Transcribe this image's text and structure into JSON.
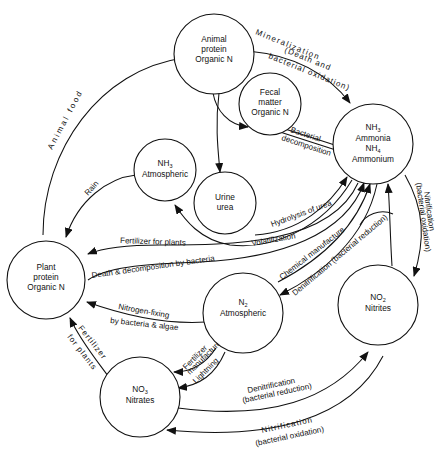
{
  "diagram": {
    "type": "flow-diagram",
    "colors": {
      "line": "#111111",
      "background": "#ffffff"
    },
    "nodes": {
      "animal_protein": {
        "line1": "Animal",
        "line2": "protein",
        "line3": "Organic N"
      },
      "fecal_matter": {
        "line1": "Fecal",
        "line2": "matter",
        "line3": "Organic N"
      },
      "ammonia": {
        "line1": "NH",
        "line1_sub": "3",
        "line2": "Ammonia",
        "line3": "NH",
        "line3_sub": "4",
        "line4": "Ammonium"
      },
      "nh3_atmospheric": {
        "line1": "NH",
        "line1_sub": "3",
        "line2": "Atmospheric"
      },
      "urine": {
        "line1": "Urine",
        "line2": "urea"
      },
      "plant_protein": {
        "line1": "Plant",
        "line2": "protein",
        "line3": "Organic N"
      },
      "n2_atmospheric": {
        "line1": "N",
        "line1_sub": "2",
        "line2": "Atmospheric"
      },
      "nitrites": {
        "line1": "NO",
        "line1_sub": "2",
        "line2": "Nitrites"
      },
      "nitrates": {
        "line1": "NO",
        "line1_sub": "3",
        "line2": "Nitrates"
      }
    },
    "edges": {
      "animal_food": "Animal food",
      "mineralization_1": "Mineralization",
      "mineralization_2": "(Death and",
      "mineralization_3": "bacterial oxidation)",
      "bacterial_decomposition_1": "Bacterial",
      "bacterial_decomposition_2": "decomposition",
      "rain": "Rain",
      "hydrolysis": "Hydrolysis of urea",
      "volatilization": "Volatilization",
      "fertilizer_for_plants": "Fertilizer for plants",
      "death_decomposition": "Death & decomposition by bacteria",
      "chemical_manufacture": "Chemical manufacture",
      "denitrification_upper": "Denitrification (bacterial reduction)",
      "nitrification_right_1": "Nitrification",
      "nitrification_right_2": "(bacterial oxidation)",
      "nitrogen_fixing_1": "Nitrogen-fixing",
      "nitrogen_fixing_2": "by bacteria & algae",
      "fertilizer_left_1": "Fertilizer",
      "fertilizer_left_2": "for plants",
      "fertilizer_manufacture_1": "Fertilizer",
      "fertilizer_manufacture_2": "manufacture",
      "lightning": "Lightning",
      "denitrification_lower_1": "Denitrification",
      "denitrification_lower_2": "(bacterial reduction)",
      "nitrification_bottom_1": "Nitrification",
      "nitrification_bottom_2": "(bacterial oxidation)"
    }
  }
}
